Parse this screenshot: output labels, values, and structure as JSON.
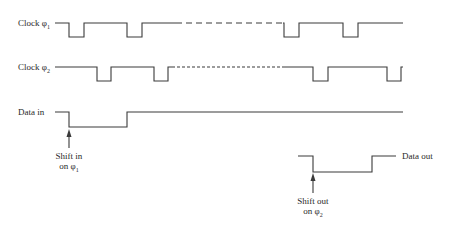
{
  "signals": {
    "clock1": {
      "label": "Clock φ",
      "sub": "1"
    },
    "clock2": {
      "label": "Clock φ",
      "sub": "2"
    },
    "data_in": {
      "label": "Data in"
    },
    "data_out": {
      "label": "Data out"
    }
  },
  "annotations": {
    "shift_in": {
      "line1": "Shift in",
      "line2": "on φ",
      "sub": "1"
    },
    "shift_out": {
      "line1": "Shift out",
      "line2": "on φ",
      "sub": "2"
    }
  },
  "colors": {
    "line": "#3a3a3a",
    "background": "#ffffff"
  }
}
